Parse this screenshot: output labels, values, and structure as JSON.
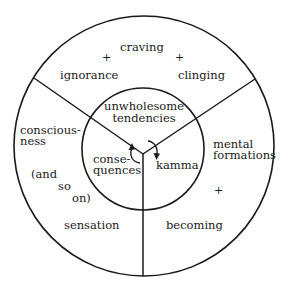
{
  "diagram": {
    "title": "",
    "colors": {
      "stroke": "#1a1a1a",
      "text": "#1a1a1a",
      "background": "#ffffff"
    },
    "outer_ring": {
      "top_sector": {
        "labels": [
          "craving",
          "ignorance",
          "clinging"
        ],
        "plus_signs": [
          "+",
          "+"
        ]
      },
      "left_sector": {
        "labels": [
          "conscious-",
          "ness",
          "(and",
          "so",
          "on)",
          "sensation"
        ]
      },
      "right_sector": {
        "labels": [
          "mental",
          "formations",
          "becoming"
        ],
        "plus_signs": [
          "+"
        ]
      }
    },
    "inner_circle": {
      "top": {
        "line1": "unwholesome",
        "line2": "tendencies"
      },
      "left": {
        "line1": "conse-",
        "line2": "quences"
      },
      "right": {
        "line1": "kamma"
      }
    },
    "arrows": [
      {
        "name": "consequences-to-tendencies",
        "direction": "up"
      },
      {
        "name": "tendencies-to-kamma",
        "direction": "down"
      }
    ]
  }
}
